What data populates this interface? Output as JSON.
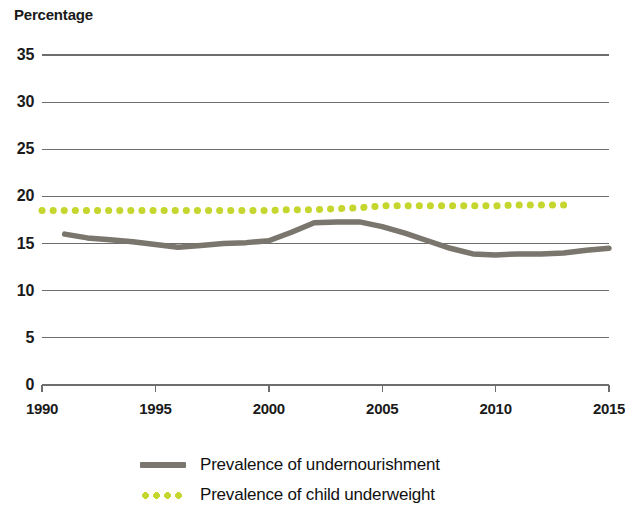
{
  "chart_data": {
    "type": "line",
    "title": "Percentage",
    "xlabel": "",
    "ylabel": "Percentage",
    "xlim": [
      1990,
      2015
    ],
    "ylim": [
      0,
      35
    ],
    "grid": true,
    "grid_axis": "y",
    "legend_position": "bottom",
    "y_ticks": [
      0,
      5,
      10,
      15,
      20,
      25,
      30,
      35
    ],
    "x_ticks": [
      1990,
      1995,
      2000,
      2005,
      2010,
      2015
    ],
    "y_tick_labels": [
      "0",
      "5",
      "10",
      "15",
      "20",
      "25",
      "30",
      "35"
    ],
    "x_tick_labels": [
      "1990",
      "1995",
      "2000",
      "2005",
      "2010",
      "2015"
    ],
    "series": [
      {
        "name": "Prevalence of undernourishment",
        "color": "#7a756d",
        "style": "solid",
        "x": [
          1991,
          1992,
          1993,
          1994,
          1995,
          1996,
          1997,
          1998,
          1999,
          2000,
          2001,
          2002,
          2003,
          2004,
          2005,
          2006,
          2007,
          2008,
          2009,
          2010,
          2011,
          2012,
          2013,
          2014,
          2015
        ],
        "values": [
          16.0,
          15.6,
          15.4,
          15.2,
          14.9,
          14.6,
          14.8,
          15.0,
          15.1,
          15.3,
          16.2,
          17.2,
          17.3,
          17.3,
          16.8,
          16.1,
          15.3,
          14.5,
          13.9,
          13.8,
          13.9,
          13.9,
          14.0,
          14.3,
          14.5
        ]
      },
      {
        "name": "Prevalence of child underweight",
        "color": "#c5d62e",
        "style": "dotted",
        "x": [
          1990,
          1991,
          1992,
          1993,
          1994,
          1995,
          1996,
          1997,
          1998,
          1999,
          2000,
          2001,
          2002,
          2003,
          2004,
          2005,
          2006,
          2007,
          2008,
          2009,
          2010,
          2011,
          2012,
          2013
        ],
        "values": [
          18.5,
          18.5,
          18.5,
          18.5,
          18.5,
          18.5,
          18.5,
          18.5,
          18.5,
          18.5,
          18.5,
          18.6,
          18.6,
          18.7,
          18.8,
          19.0,
          19.0,
          19.0,
          19.0,
          19.0,
          19.0,
          19.1,
          19.1,
          19.1
        ]
      }
    ],
    "legend": [
      {
        "label": "Prevalence of undernourishment",
        "color": "#7a756d",
        "style": "solid"
      },
      {
        "label": "Prevalence of child underweight",
        "color": "#c5d62e",
        "style": "dotted"
      }
    ],
    "colors": {
      "undernourishment": "#7a756d",
      "child_underweight": "#c5d62e",
      "gridline": "#6d6d6d",
      "text": "#1a1a1a"
    }
  }
}
